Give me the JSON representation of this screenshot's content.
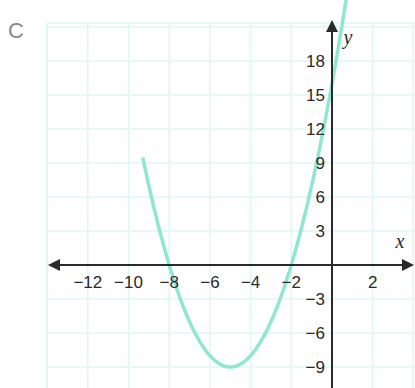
{
  "panel_label": "C",
  "chart_data": {
    "type": "line",
    "title": "",
    "function": "y = x^2 + 10x + 16",
    "xlabel": "x",
    "ylabel": "y",
    "xlim": [
      -14,
      4
    ],
    "ylim": [
      -11,
      21.4
    ],
    "x_ticks": [
      -12,
      -10,
      -8,
      -6,
      -4,
      -2,
      2
    ],
    "y_ticks": [
      18,
      15,
      12,
      9,
      6,
      3,
      -3,
      -6,
      -9
    ],
    "grid": true,
    "x_grid_step": 2,
    "y_grid_step": 3,
    "roots": [
      -8,
      -2
    ],
    "vertex": [
      -5,
      -9
    ],
    "y_intercept": 16,
    "series": [
      {
        "name": "parabola",
        "color": "#8ee8cf",
        "x": [
          -9.2,
          -9,
          -8,
          -7,
          -6,
          -5,
          -4,
          -3,
          -2,
          -1,
          0,
          0.7
        ],
        "y": [
          10.64,
          7,
          0,
          -5,
          -8,
          -9,
          -8,
          -5,
          0,
          7,
          16,
          23.49
        ]
      }
    ]
  },
  "colors": {
    "grid": "#dff7f1",
    "curve": "#8ee8cf",
    "axis": "#2a2a2a",
    "label": "#8a8a8a"
  }
}
